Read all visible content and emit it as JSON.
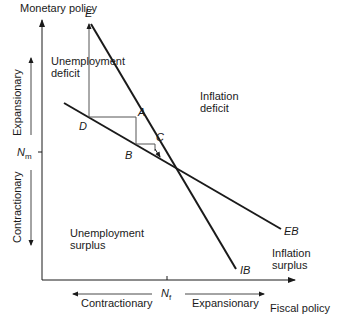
{
  "diagram": {
    "axes": {
      "y_label": "Monetary policy",
      "x_label": "Fiscal policy",
      "y_up_label": "Expansionary",
      "y_down_label": "Contractionary",
      "x_left_label": "Contractionary",
      "x_right_label": "Expansionary",
      "y_tick": {
        "main": "N",
        "sub": "m"
      },
      "x_tick": {
        "main": "N",
        "sub": "f"
      }
    },
    "lines": [
      {
        "name": "IB",
        "label": "IB"
      },
      {
        "name": "EB",
        "label": "EB"
      }
    ],
    "points": {
      "E": "E",
      "A": "A",
      "B": "B",
      "C": "C",
      "D": "D"
    },
    "regions": {
      "top_left": [
        "Unemployment",
        "deficit"
      ],
      "top_right": [
        "Inflation",
        "deficit"
      ],
      "bottom_left": [
        "Unemployment",
        "surplus"
      ],
      "bottom_right": [
        "Inflation",
        "surplus"
      ]
    },
    "colors": {
      "line": "#1a1a1a",
      "path": "#555555"
    }
  }
}
